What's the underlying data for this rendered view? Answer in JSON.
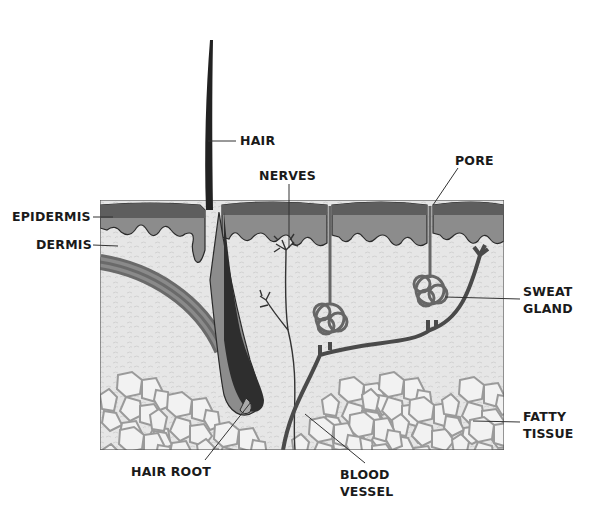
{
  "diagram": {
    "colors": {
      "epidermis_top": "#5e5e5e",
      "epidermis_lower": "#8c8c8c",
      "dermis": "#e4e4e4",
      "fat_cells": "#f0f0f0",
      "fat_cell_border": "#9a9a9a",
      "hair": "#222222",
      "vessel": "#4a4a4a",
      "outline": "#2a2a2a"
    },
    "labels": {
      "hair": "HAIR",
      "nerves": "NERVES",
      "pore": "PORE",
      "epidermis": "EPIDERMIS",
      "dermis": "DERMIS",
      "sweat_gland_1": "SWEAT",
      "sweat_gland_2": "GLAND",
      "fatty_tissue_1": "FATTY",
      "fatty_tissue_2": "TISSUE",
      "hair_root": "HAIR ROOT",
      "blood_vessel_1": "BLOOD",
      "blood_vessel_2": "VESSEL"
    }
  }
}
